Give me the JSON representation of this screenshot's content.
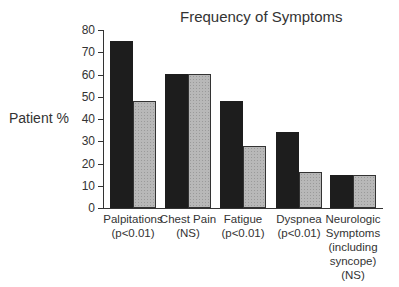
{
  "chart_data": {
    "type": "bar",
    "title": "Frequency of Symptoms",
    "xlabel": "",
    "ylabel": "Patient %",
    "ylim": [
      0,
      80
    ],
    "yticks": [
      0,
      10,
      20,
      30,
      40,
      50,
      60,
      70,
      80
    ],
    "grid": false,
    "legend": null,
    "categories": [
      "Palpitations (p<0.01)",
      "Chest Pain (NS)",
      "Fatigue (p<0.01)",
      "Dyspnea (p<0.01)",
      "Neurologic Symptoms (including syncope) (NS)"
    ],
    "category_lines": [
      [
        "Palpitations",
        "(p<0.01)"
      ],
      [
        "Chest Pain",
        "(NS)"
      ],
      [
        "Fatigue",
        "(p<0.01)"
      ],
      [
        "Dyspnea",
        "(p<0.01)"
      ],
      [
        "Neurologic",
        "Symptoms",
        "(including",
        "syncope)",
        "(NS)"
      ]
    ],
    "series": [
      {
        "name": "Group 1 (dark)",
        "color": "#1d1d1d",
        "values": [
          75,
          60,
          48,
          34,
          15
        ]
      },
      {
        "name": "Group 2 (stippled gray)",
        "color": "#b8b8b8",
        "values": [
          48,
          60,
          28,
          16,
          15
        ]
      }
    ]
  }
}
